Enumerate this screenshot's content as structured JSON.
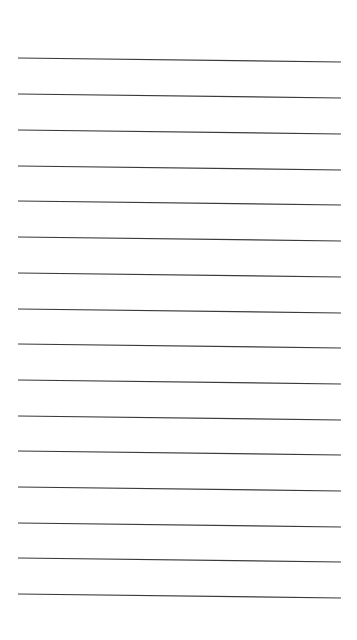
{
  "page": {
    "type": "lined-paper",
    "background_color": "#ffffff",
    "line_color": "#3a3a3a",
    "line_count": 16,
    "line_x_start": 18,
    "line_x_end": 341,
    "line_slope_px": 4,
    "line_y_positions": [
      58,
      94,
      130,
      166,
      201,
      237,
      273,
      309,
      344,
      380,
      416,
      451,
      487,
      523,
      558,
      594
    ],
    "text_content": ""
  }
}
